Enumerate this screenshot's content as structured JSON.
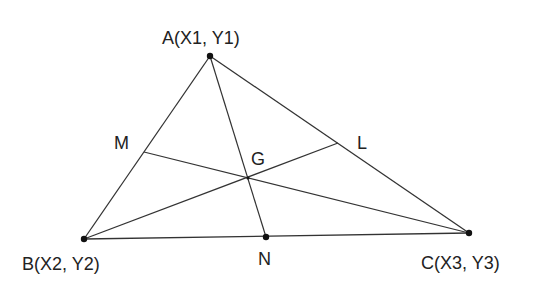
{
  "diagram": {
    "title": "",
    "colors": {
      "line": "#333333",
      "dot": "#111111",
      "text": "#222222",
      "background": "#ffffff"
    },
    "vertices": {
      "A": {
        "label": "A(X1,  Y1)",
        "x": 210,
        "y": 56
      },
      "B": {
        "label": "B(X2,  Y2)",
        "x": 84,
        "y": 239
      },
      "C": {
        "label": "C(X3,  Y3)",
        "x": 469,
        "y": 233
      }
    },
    "midpoints": {
      "M": {
        "label": "M",
        "x": 144,
        "y": 152,
        "side": "AB"
      },
      "N": {
        "label": "N",
        "x": 266,
        "y": 237,
        "side": "BC"
      },
      "L": {
        "label": "L",
        "x": 338,
        "y": 143,
        "side": "AC"
      }
    },
    "centroid": {
      "label": "G",
      "x": 248,
      "y": 178
    },
    "medians": [
      {
        "from": "A",
        "to": "N"
      },
      {
        "from": "B",
        "to": "L"
      },
      {
        "from": "C",
        "to": "M"
      }
    ]
  }
}
